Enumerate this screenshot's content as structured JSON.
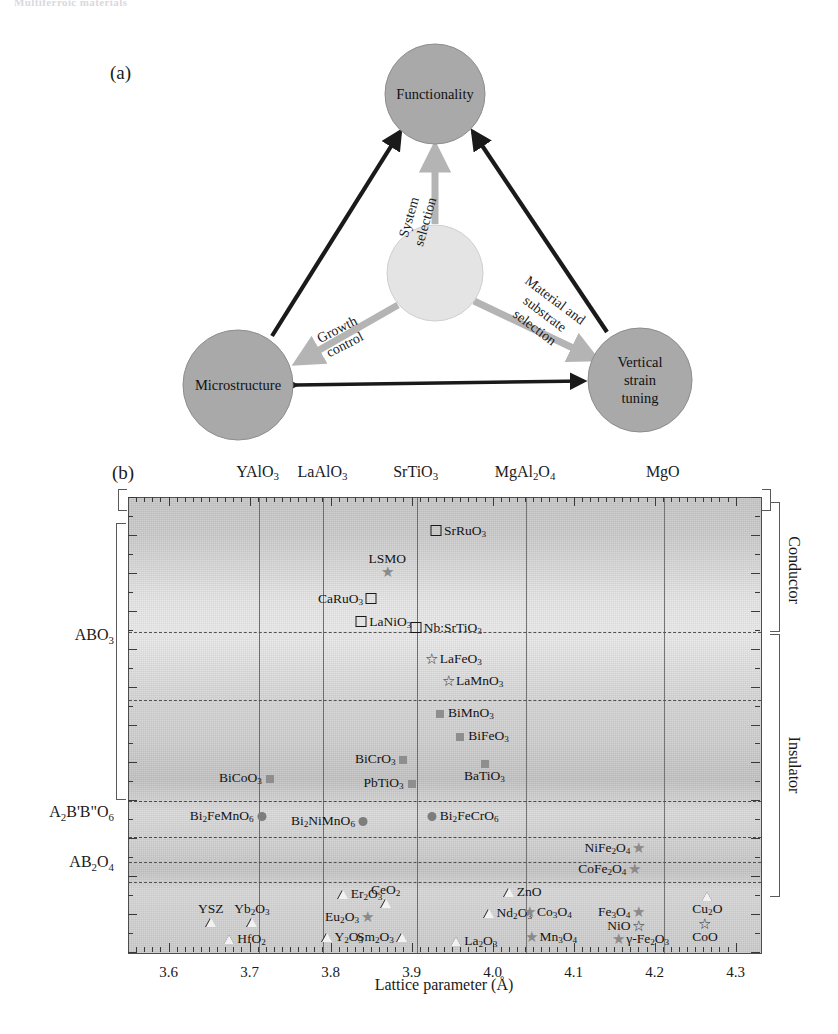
{
  "running_head": "Multiferroic materials",
  "panel_a": {
    "tag": "(a)",
    "nodes": [
      {
        "id": "functionality",
        "label": "Functionality",
        "cx": 435,
        "cy": 70,
        "r": 50,
        "fill": "#a8a8a8"
      },
      {
        "id": "center",
        "label": "",
        "cx": 435,
        "cy": 249,
        "r": 48,
        "fill": "#e2e2e2"
      },
      {
        "id": "microstructure",
        "label": "Microstructure",
        "cx": 238,
        "cy": 361,
        "r": 55,
        "fill": "#a8a8a8"
      },
      {
        "id": "vertical_strain",
        "label": "Vertical strain tuning",
        "label_lines": [
          "Vertical",
          "strain",
          "tuning"
        ],
        "cx": 640,
        "cy": 356,
        "r": 52,
        "fill": "#a8a8a8"
      }
    ],
    "edge_labels": [
      {
        "id": "system-selection",
        "lines": [
          "System",
          "selection"
        ],
        "x": 419,
        "y": 196,
        "rotate": -74
      },
      {
        "id": "growth-control",
        "lines": [
          "Growth",
          "control"
        ],
        "x": 341,
        "y": 313,
        "rotate": -27
      },
      {
        "id": "material-substrate-selection",
        "lines": [
          "Material and",
          "substrate",
          "selection"
        ],
        "x": 547,
        "y": 287,
        "rotate": 37
      }
    ]
  },
  "panel_b": {
    "tag": "(b)",
    "xaxis_title": "Lattice parameter (Å)",
    "xticks": [
      "3.6",
      "3.7",
      "3.8",
      "3.9",
      "4.0",
      "4.1",
      "4.2",
      "4.3"
    ],
    "top_substrates": [
      {
        "name": "YAlO<sub>3</sub>",
        "value": 3.71
      },
      {
        "name": "LaAlO<sub>3</sub>",
        "value": 3.79
      },
      {
        "name": "SrTiO<sub>3</sub>",
        "value": 3.905
      },
      {
        "name": "MgAl<sub>2</sub>O<sub>4</sub>",
        "value": 4.04
      },
      {
        "name": "MgO",
        "value": 4.21
      }
    ],
    "row_labels": [
      {
        "name": "ABO<sub>3</sub>",
        "y_frac": 0.305
      },
      {
        "name": "A<sub>2</sub>B'B\"O<sub>6</sub>",
        "y_frac": 0.695
      },
      {
        "name": "AB<sub>2</sub>O<sub>4</sub>",
        "y_frac": 0.805
      }
    ],
    "side_labels": [
      {
        "name": "Conductor",
        "y_frac": 0.16
      },
      {
        "name": "Insulator",
        "y_frac": 0.59
      }
    ]
  },
  "chart_data": {
    "type": "scatter",
    "xlabel": "Lattice parameter (Å)",
    "ylabel": "",
    "xlim": [
      3.55,
      4.33
    ],
    "grid": false,
    "legend": "none",
    "x_tick_values": [
      3.6,
      3.7,
      3.8,
      3.9,
      4.0,
      4.1,
      4.2,
      4.3
    ],
    "vertical_reference_lines": [
      {
        "label": "YAlO3",
        "x": 3.71
      },
      {
        "label": "LaAlO3",
        "x": 3.79
      },
      {
        "label": "SrTiO3",
        "x": 3.905
      },
      {
        "label": "MgAl2O4",
        "x": 4.04
      },
      {
        "label": "MgO",
        "x": 4.21
      }
    ],
    "horizontal_dashed_bands": [
      0.295,
      0.445,
      0.665,
      0.745,
      0.8,
      0.845
    ],
    "groups": [
      {
        "name": "Conductor (ABO3)",
        "marker": "open-square",
        "points": [
          {
            "label": "SrRuO<sub>3</sub>",
            "x": 3.93,
            "y_frac": 0.075,
            "label_side": "right"
          },
          {
            "label": "CaRuO<sub>3</sub>",
            "x": 3.85,
            "y_frac": 0.225,
            "label_side": "left"
          },
          {
            "label": "LaNiO<sub>3</sub>",
            "x": 3.838,
            "y_frac": 0.275,
            "label_side": "right"
          },
          {
            "label": "Nb:SrTiO<sub>3</sub>",
            "x": 3.905,
            "y_frac": 0.287,
            "label_side": "right"
          }
        ]
      },
      {
        "name": "Conductor star (ABO3)",
        "marker": "filled-star",
        "points": [
          {
            "label": "LSMO",
            "x": 3.87,
            "y_frac": 0.165,
            "label_side": "above"
          }
        ]
      },
      {
        "name": "Insulator (ABO3) open star",
        "marker": "open-star",
        "points": [
          {
            "label": "LaFeO<sub>3</sub>",
            "x": 3.925,
            "y_frac": 0.355,
            "label_side": "right"
          },
          {
            "label": "LaMnO<sub>3</sub>",
            "x": 3.945,
            "y_frac": 0.405,
            "label_side": "right"
          }
        ]
      },
      {
        "name": "Insulator (ABO3) filled square",
        "marker": "filled-square",
        "points": [
          {
            "label": "BiMnO<sub>3</sub>",
            "x": 3.935,
            "y_frac": 0.475,
            "label_side": "right"
          },
          {
            "label": "BiFeO<sub>3</sub>",
            "x": 3.96,
            "y_frac": 0.525,
            "label_side": "right"
          },
          {
            "label": "BiCrO<sub>3</sub>",
            "x": 3.89,
            "y_frac": 0.575,
            "label_side": "left"
          },
          {
            "label": "BaTiO<sub>3</sub>",
            "x": 3.99,
            "y_frac": 0.585,
            "label_side": "below"
          },
          {
            "label": "PbTiO<sub>3</sub>",
            "x": 3.9,
            "y_frac": 0.628,
            "label_side": "left"
          },
          {
            "label": "BiCoO<sub>3</sub>",
            "x": 3.725,
            "y_frac": 0.617,
            "label_side": "left"
          }
        ]
      },
      {
        "name": "A2B'B\"O6 double perovskites",
        "marker": "filled-circle",
        "points": [
          {
            "label": "Bi<sub>2</sub>FeMnO<sub>6</sub>",
            "x": 3.715,
            "y_frac": 0.7,
            "label_side": "left"
          },
          {
            "label": "Bi<sub>2</sub>NiMnO<sub>6</sub>",
            "x": 3.84,
            "y_frac": 0.712,
            "label_side": "left"
          },
          {
            "label": "Bi<sub>2</sub>FeCrO<sub>6</sub>",
            "x": 3.925,
            "y_frac": 0.7,
            "label_side": "right"
          }
        ]
      },
      {
        "name": "AB2O4 spinels",
        "marker": "filled-star",
        "points": [
          {
            "label": "NiFe<sub>2</sub>O<sub>4</sub>",
            "x": 4.18,
            "y_frac": 0.772,
            "label_side": "left"
          },
          {
            "label": "CoFe<sub>2</sub>O<sub>4</sub>",
            "x": 4.175,
            "y_frac": 0.818,
            "label_side": "left"
          }
        ]
      },
      {
        "name": "Binary oxides open triangle",
        "marker": "open-triangle",
        "points": [
          {
            "label": "Er<sub>2</sub>O<sub>3</sub>",
            "x": 3.815,
            "y_frac": 0.873,
            "label_side": "right"
          },
          {
            "label": "CeO<sub>2</sub>",
            "x": 3.868,
            "y_frac": 0.893,
            "label_side": "above"
          },
          {
            "label": "ZnO",
            "x": 4.02,
            "y_frac": 0.868,
            "label_side": "right"
          },
          {
            "label": "Nd<sub>2</sub>O<sub>3</sub>",
            "x": 3.995,
            "y_frac": 0.915,
            "label_side": "right"
          },
          {
            "label": "YSZ",
            "x": 3.652,
            "y_frac": 0.933,
            "label_side": "above"
          },
          {
            "label": "Yb<sub>2</sub>O<sub>3</sub>",
            "x": 3.703,
            "y_frac": 0.933,
            "label_side": "above"
          },
          {
            "label": "HfO<sub>2</sub>",
            "x": 3.675,
            "y_frac": 0.972,
            "label_side": "right"
          },
          {
            "label": "Y<sub>2</sub>O<sub>3</sub>",
            "x": 3.795,
            "y_frac": 0.968,
            "label_side": "right"
          },
          {
            "label": "Sm<sub>2</sub>O<sub>3</sub>",
            "x": 3.888,
            "y_frac": 0.968,
            "label_side": "left"
          },
          {
            "label": "La<sub>2</sub>O<sub>3</sub>",
            "x": 3.955,
            "y_frac": 0.975,
            "label_side": "right"
          },
          {
            "label": "Cu<sub>2</sub>O",
            "x": 4.265,
            "y_frac": 0.877,
            "label_side": "below"
          }
        ]
      },
      {
        "name": "Binary oxides filled star",
        "marker": "filled-star",
        "points": [
          {
            "label": "Eu<sub>2</sub>O<sub>3</sub>",
            "x": 3.845,
            "y_frac": 0.922,
            "label_side": "left"
          },
          {
            "label": "Co<sub>3</sub>O<sub>4</sub>",
            "x": 4.045,
            "y_frac": 0.912,
            "label_side": "right"
          },
          {
            "label": "Fe<sub>3</sub>O<sub>4</sub>",
            "x": 4.18,
            "y_frac": 0.912,
            "label_side": "left"
          },
          {
            "label": "Mn<sub>3</sub>O<sub>4</sub>",
            "x": 4.048,
            "y_frac": 0.968,
            "label_side": "right"
          },
          {
            "label": "γ-Fe<sub>2</sub>O<sub>3</sub>",
            "x": 4.155,
            "y_frac": 0.972,
            "label_side": "right"
          }
        ]
      },
      {
        "name": "Binary oxides open star",
        "marker": "open-star",
        "points": [
          {
            "label": "NiO",
            "x": 4.18,
            "y_frac": 0.942,
            "label_side": "left"
          },
          {
            "label": "CoO",
            "x": 4.262,
            "y_frac": 0.938,
            "label_side": "below"
          }
        ]
      }
    ]
  }
}
